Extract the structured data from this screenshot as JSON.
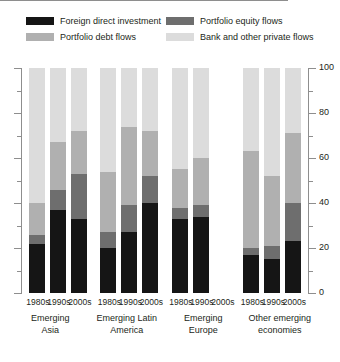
{
  "legend": {
    "items": [
      {
        "label": "Foreign direct investment",
        "color": "#151515",
        "key": "fdi"
      },
      {
        "label": "Portfolio equity flows",
        "color": "#6e6e6e",
        "key": "equity"
      },
      {
        "label": "Portfolio debt flows",
        "color": "#b0b0b0",
        "key": "debt"
      },
      {
        "label": "Bank and other private flows",
        "color": "#dcdcdc",
        "key": "bank"
      }
    ]
  },
  "axis": {
    "major_ticks": [
      0,
      20,
      40,
      60,
      80,
      100
    ],
    "minor_ticks": [
      10,
      30,
      50,
      70,
      90
    ],
    "tick_labels": [
      "0",
      "20",
      "40",
      "60",
      "80",
      "100"
    ],
    "min": 0,
    "max": 100,
    "label_side": "right"
  },
  "chart_data": {
    "type": "bar",
    "title": "",
    "subtitle": "",
    "xlabel": "",
    "ylabel": "",
    "ylim": [
      0,
      100
    ],
    "stacked": true,
    "normalized_percent": true,
    "grid": false,
    "legend_position": "top",
    "categories": [
      "Emerging Asia",
      "Emerging Latin America",
      "Emerging Europe",
      "Other emerging economies"
    ],
    "subcategories": [
      "1980s",
      "1990s",
      "2000s"
    ],
    "series": [
      {
        "name": "Foreign direct investment",
        "color": "#151515",
        "values": [
          [
            22,
            37,
            33
          ],
          [
            20,
            27,
            40
          ],
          [
            33,
            34,
            null
          ],
          [
            17,
            15,
            23
          ]
        ]
      },
      {
        "name": "Portfolio equity flows",
        "color": "#6e6e6e",
        "values": [
          [
            4,
            9,
            20
          ],
          [
            7,
            12,
            12
          ],
          [
            5,
            5,
            null
          ],
          [
            3,
            6,
            17
          ]
        ]
      },
      {
        "name": "Portfolio debt flows",
        "color": "#b0b0b0",
        "values": [
          [
            14,
            21,
            19
          ],
          [
            27,
            35,
            20
          ],
          [
            17,
            21,
            null
          ],
          [
            43,
            31,
            31
          ]
        ]
      },
      {
        "name": "Bank and other private flows",
        "color": "#dcdcdc",
        "values": [
          [
            60,
            33,
            28
          ],
          [
            46,
            26,
            28
          ],
          [
            45,
            40,
            null
          ],
          [
            37,
            48,
            29
          ]
        ]
      }
    ],
    "notes": [
      "Emerging Europe 2000s bar has no data (empty slot)."
    ]
  },
  "colors": {
    "axis": "#8e8e8e",
    "text": "#231f20",
    "background": "#ffffff"
  }
}
